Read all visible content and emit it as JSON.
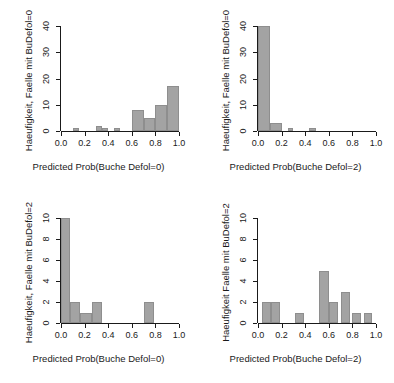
{
  "figure": {
    "background": "#ffffff",
    "bar_fill": "#a3a3a3",
    "bar_border": "#8e8e8e",
    "axis_color": "#1a1a1a",
    "layout": "2x2 grid of histograms"
  },
  "chart_data": [
    {
      "type": "bar",
      "panel": "top-left",
      "title": "",
      "xlabel": "Predicted Prob(Buche Defol=0)",
      "ylabel": "Haeufigkeit, Faelle mit BuDefol=0",
      "xlim": [
        0.0,
        1.0
      ],
      "ylim": [
        0,
        40
      ],
      "xticks": [
        "0.0",
        "0.2",
        "0.4",
        "0.6",
        "0.8",
        "1.0"
      ],
      "xtick_values": [
        0.0,
        0.2,
        0.4,
        0.6,
        0.8,
        1.0
      ],
      "yticks": [
        "0",
        "10",
        "20",
        "30",
        "40"
      ],
      "ytick_values": [
        0,
        10,
        20,
        30,
        40
      ],
      "grid": false,
      "legend": "none",
      "bin_width": 0.05,
      "bins": [
        {
          "x0": 0.1,
          "x1": 0.15,
          "value": 1
        },
        {
          "x0": 0.3,
          "x1": 0.35,
          "value": 2
        },
        {
          "x0": 0.35,
          "x1": 0.4,
          "value": 1
        },
        {
          "x0": 0.45,
          "x1": 0.5,
          "value": 1
        },
        {
          "x0": 0.6,
          "x1": 0.7,
          "value": 8
        },
        {
          "x0": 0.7,
          "x1": 0.8,
          "value": 5
        },
        {
          "x0": 0.8,
          "x1": 0.9,
          "value": 10
        },
        {
          "x0": 0.9,
          "x1": 1.0,
          "value": 17
        }
      ]
    },
    {
      "type": "bar",
      "panel": "top-right",
      "title": "",
      "xlabel": "Predicted Prob(Buche Defol=2)",
      "ylabel": "Haeufigkeit, Faelle mit BuDefol=0",
      "xlim": [
        0.0,
        1.0
      ],
      "ylim": [
        0,
        40
      ],
      "xticks": [
        "0.0",
        "0.2",
        "0.4",
        "0.6",
        "0.8",
        "1.0"
      ],
      "xtick_values": [
        0.0,
        0.2,
        0.4,
        0.6,
        0.8,
        1.0
      ],
      "yticks": [
        "0",
        "10",
        "20",
        "30",
        "40"
      ],
      "ytick_values": [
        0,
        10,
        20,
        30,
        40
      ],
      "grid": false,
      "legend": "none",
      "bin_width": 0.05,
      "bins": [
        {
          "x0": 0.0,
          "x1": 0.1,
          "value": 40
        },
        {
          "x0": 0.1,
          "x1": 0.2,
          "value": 3
        },
        {
          "x0": 0.25,
          "x1": 0.3,
          "value": 1
        },
        {
          "x0": 0.43,
          "x1": 0.49,
          "value": 1
        }
      ]
    },
    {
      "type": "bar",
      "panel": "bottom-left",
      "title": "",
      "xlabel": "Predicted Prob(Buche Defol=0)",
      "ylabel": "Haeufigkeit, Faelle mit BuDefol=2",
      "xlim": [
        0.0,
        1.0
      ],
      "ylim": [
        0,
        10
      ],
      "xticks": [
        "0.0",
        "0.2",
        "0.4",
        "0.6",
        "0.8",
        "1.0"
      ],
      "xtick_values": [
        0.0,
        0.2,
        0.4,
        0.6,
        0.8,
        1.0
      ],
      "yticks": [
        "0",
        "2",
        "4",
        "6",
        "8",
        "10"
      ],
      "ytick_values": [
        0,
        2,
        4,
        6,
        8,
        10
      ],
      "grid": false,
      "legend": "none",
      "bin_width": 0.05,
      "bins": [
        {
          "x0": 0.0,
          "x1": 0.08,
          "value": 10
        },
        {
          "x0": 0.08,
          "x1": 0.16,
          "value": 2
        },
        {
          "x0": 0.16,
          "x1": 0.26,
          "value": 1
        },
        {
          "x0": 0.26,
          "x1": 0.35,
          "value": 2
        },
        {
          "x0": 0.7,
          "x1": 0.79,
          "value": 2
        }
      ]
    },
    {
      "type": "bar",
      "panel": "bottom-right",
      "title": "",
      "xlabel": "Predicted Prob(Buche Defol=2)",
      "ylabel": "Haeufigkeit Faelle mit BuDefol=2",
      "xlim": [
        0.0,
        1.0
      ],
      "ylim": [
        0,
        10
      ],
      "xticks": [
        "0.0",
        "0.2",
        "0.4",
        "0.6",
        "0.8",
        "1.0"
      ],
      "xtick_values": [
        0.0,
        0.2,
        0.4,
        0.6,
        0.8,
        1.0
      ],
      "yticks": [
        "0",
        "2",
        "4",
        "6",
        "8",
        "10"
      ],
      "ytick_values": [
        0,
        2,
        4,
        6,
        8,
        10
      ],
      "grid": false,
      "legend": "none",
      "bin_width": 0.05,
      "bins": [
        {
          "x0": 0.03,
          "x1": 0.11,
          "value": 2
        },
        {
          "x0": 0.11,
          "x1": 0.19,
          "value": 2
        },
        {
          "x0": 0.31,
          "x1": 0.39,
          "value": 1
        },
        {
          "x0": 0.52,
          "x1": 0.6,
          "value": 5
        },
        {
          "x0": 0.6,
          "x1": 0.68,
          "value": 2
        },
        {
          "x0": 0.7,
          "x1": 0.78,
          "value": 3
        },
        {
          "x0": 0.8,
          "x1": 0.87,
          "value": 1
        },
        {
          "x0": 0.9,
          "x1": 0.97,
          "value": 1
        }
      ]
    }
  ]
}
